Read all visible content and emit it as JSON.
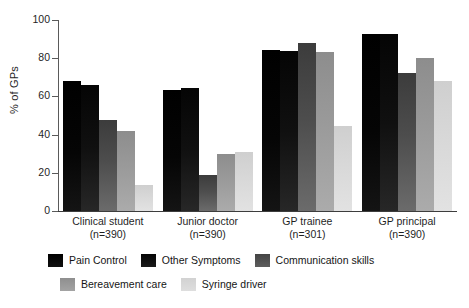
{
  "chart_data": {
    "type": "bar",
    "title": "",
    "subtitle": "",
    "xlabel": "",
    "ylabel": "% of GPs",
    "ylim": [
      0,
      100
    ],
    "yticks": [
      0,
      20,
      40,
      60,
      80,
      100
    ],
    "ytick_labels": [
      "0",
      "20",
      "40",
      "60",
      "80",
      "100"
    ],
    "grid": false,
    "legend_position": "bottom",
    "categories": [
      "Clinical student",
      "Junior doctor",
      "GP trainee",
      "GP principal"
    ],
    "category_sublabels": [
      "(n=390)",
      "(n=390)",
      "(n=301)",
      "(n=390)"
    ],
    "series": [
      {
        "name": "Pain Control",
        "color": "#080808",
        "values": [
          68,
          63.5,
          84.5,
          92.5
        ]
      },
      {
        "name": "Other Symptoms",
        "color": "#121212",
        "values": [
          66,
          64.5,
          84,
          92.5
        ]
      },
      {
        "name": "Communication skills",
        "color": "#4d4d4d",
        "values": [
          47.5,
          19,
          88,
          72.5
        ]
      },
      {
        "name": "Bereavement care",
        "color": "#9a9a9a",
        "values": [
          42,
          30,
          83,
          80
        ]
      },
      {
        "name": "Syringe driver",
        "color": "#d8d8d8",
        "values": [
          13.5,
          31,
          44.5,
          68
        ]
      }
    ]
  }
}
